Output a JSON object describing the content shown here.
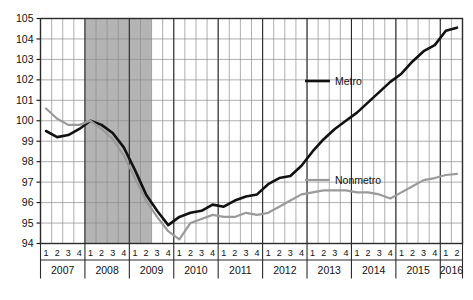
{
  "chart_data": {
    "type": "line",
    "title": "",
    "subtitle": "",
    "xlabel": "",
    "ylabel": "",
    "ylim": [
      94,
      105
    ],
    "ytick_labels": [
      "94",
      "95",
      "96",
      "97",
      "98",
      "99",
      "100",
      "101",
      "102",
      "103",
      "104",
      "105"
    ],
    "ytick_values": [
      94,
      95,
      96,
      97,
      98,
      99,
      100,
      101,
      102,
      103,
      104,
      105
    ],
    "grid": true,
    "legend_position": "inside-right",
    "quarter_labels": [
      "1",
      "2",
      "3",
      "4"
    ],
    "years": [
      "2007",
      "2008",
      "2009",
      "2010",
      "2011",
      "2012",
      "2013",
      "2014",
      "2015",
      "2016"
    ],
    "year_quarter_counts": [
      4,
      4,
      4,
      4,
      4,
      4,
      4,
      4,
      4,
      2
    ],
    "x": [
      "2007Q1",
      "2007Q2",
      "2007Q3",
      "2007Q4",
      "2008Q1",
      "2008Q2",
      "2008Q3",
      "2008Q4",
      "2009Q1",
      "2009Q2",
      "2009Q3",
      "2009Q4",
      "2010Q1",
      "2010Q2",
      "2010Q3",
      "2010Q4",
      "2011Q1",
      "2011Q2",
      "2011Q3",
      "2011Q4",
      "2012Q1",
      "2012Q2",
      "2012Q3",
      "2012Q4",
      "2013Q1",
      "2013Q2",
      "2013Q3",
      "2013Q4",
      "2014Q1",
      "2014Q2",
      "2014Q3",
      "2014Q4",
      "2015Q1",
      "2015Q2",
      "2015Q3",
      "2015Q4",
      "2016Q1",
      "2016Q2"
    ],
    "series": [
      {
        "name": "Metro",
        "color": "#111111",
        "width": 2.6,
        "values": [
          99.5,
          99.2,
          99.3,
          99.6,
          100.0,
          99.8,
          99.4,
          98.7,
          97.6,
          96.4,
          95.6,
          94.9,
          95.3,
          95.5,
          95.6,
          95.9,
          95.8,
          96.1,
          96.3,
          96.4,
          96.9,
          97.2,
          97.3,
          97.8,
          98.5,
          99.1,
          99.6,
          100.0,
          100.4,
          100.9,
          101.4,
          101.9,
          102.3,
          102.9,
          103.4,
          103.7,
          104.4,
          104.55
        ]
      },
      {
        "name": "Nonmetro",
        "color": "#9a9a9a",
        "width": 2.2,
        "values": [
          100.6,
          100.1,
          99.8,
          99.8,
          100.0,
          99.6,
          99.1,
          98.3,
          97.2,
          96.1,
          95.3,
          94.6,
          94.2,
          95.0,
          95.2,
          95.4,
          95.3,
          95.3,
          95.5,
          95.4,
          95.5,
          95.8,
          96.1,
          96.4,
          96.5,
          96.6,
          96.6,
          96.6,
          96.5,
          96.5,
          96.4,
          96.2,
          96.5,
          96.8,
          97.1,
          97.2,
          97.35,
          97.4
        ]
      }
    ],
    "shaded_band": {
      "label": "",
      "color": "#b4b4b4",
      "start": "2008Q1",
      "end": "2009Q2"
    }
  },
  "legend": {
    "items": [
      {
        "label": "Metro",
        "color": "#111111"
      },
      {
        "label": "Nonmetro",
        "color": "#9a9a9a"
      }
    ]
  }
}
